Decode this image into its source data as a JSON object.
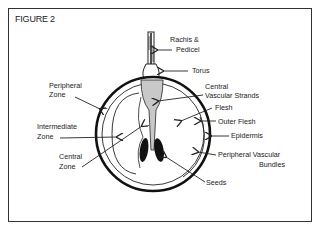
{
  "figure": {
    "title": "FIGURE 2"
  },
  "labels": {
    "rachis_line1": "Rachis &",
    "rachis_line2": "Pedicel",
    "torus": "Torus",
    "central_vascular_line1": "Central",
    "central_vascular_line2": "Vascular Strands",
    "flesh": "Flesh",
    "outer_flesh": "Outer Flesh",
    "epidermis": "Epidermis",
    "peripheral_vascular_line1": "Peripheral Vascular",
    "peripheral_vascular_line2": "Bundles",
    "seeds": "Seeds",
    "peripheral_zone_line1": "Peripheral",
    "peripheral_zone_line2": "Zone",
    "intermediate_zone_line1": "Intermediate",
    "intermediate_zone_line2": "Zone",
    "central_zone_line1": "Central",
    "central_zone_line2": "Zone"
  },
  "colors": {
    "ink": "#222222",
    "vascular_fill": "#c8c8c8",
    "seed_fill": "#111111",
    "background": "#ffffff"
  }
}
